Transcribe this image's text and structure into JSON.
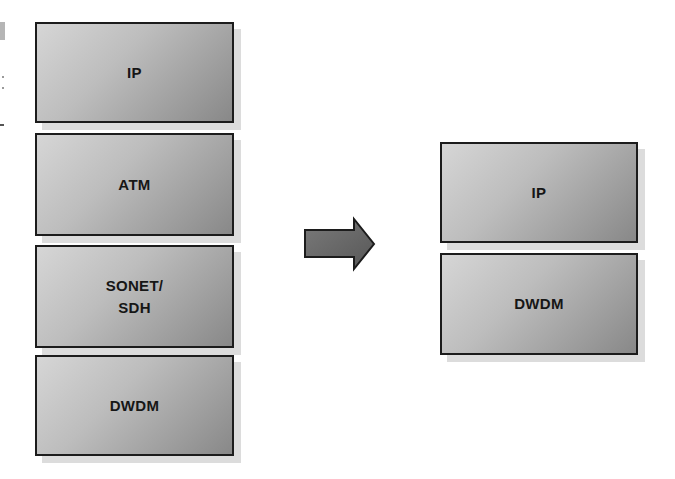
{
  "diagram": {
    "title": "",
    "left_stack": {
      "layers": [
        {
          "label": "IP"
        },
        {
          "label": "ATM"
        },
        {
          "label": "SONET/\nSDH"
        },
        {
          "label": "DWDM"
        }
      ]
    },
    "transition": {
      "icon": "right-arrow-icon",
      "meaning": "evolves-to"
    },
    "right_stack": {
      "layers": [
        {
          "label": "IP"
        },
        {
          "label": "DWDM"
        }
      ]
    },
    "colors": {
      "box_fill_light": "#d6d6d6",
      "box_fill_dark": "#888888",
      "box_border": "#1c1c1c",
      "box_shadow": "#dcdcdc",
      "label_text": "#161616",
      "arrow_fill": "#6a6a6a",
      "arrow_border": "#1c1c1c"
    }
  }
}
